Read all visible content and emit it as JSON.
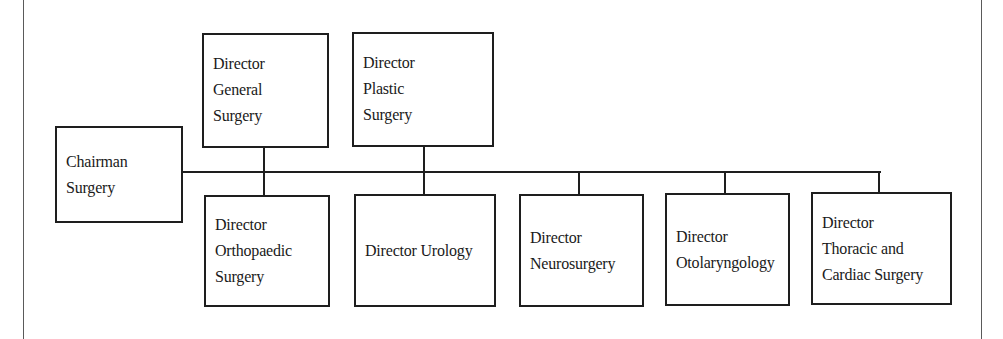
{
  "diagram": {
    "type": "org-chart",
    "root": {
      "id": "chairman",
      "lines": [
        "Chairman",
        "Surgery"
      ]
    },
    "top_row": [
      {
        "id": "general-surgery",
        "lines": [
          "Director",
          "General",
          "Surgery"
        ]
      },
      {
        "id": "plastic-surgery",
        "lines": [
          "Director",
          "Plastic",
          "Surgery"
        ]
      }
    ],
    "bottom_row": [
      {
        "id": "orthopaedic-surgery",
        "lines": [
          "Director",
          "Orthopaedic",
          "Surgery"
        ]
      },
      {
        "id": "urology",
        "lines": [
          "Director Urology"
        ]
      },
      {
        "id": "neurosurgery",
        "lines": [
          "Director",
          "Neurosurgery"
        ]
      },
      {
        "id": "otolaryngology",
        "lines": [
          "Director",
          "Otolaryngology"
        ]
      },
      {
        "id": "thoracic-cardiac-surgery",
        "lines": [
          "Director",
          "Thoracic and",
          "Cardiac Surgery"
        ]
      }
    ],
    "edges": [
      [
        "chairman",
        "general-surgery"
      ],
      [
        "chairman",
        "plastic-surgery"
      ],
      [
        "chairman",
        "orthopaedic-surgery"
      ],
      [
        "chairman",
        "urology"
      ],
      [
        "chairman",
        "neurosurgery"
      ],
      [
        "chairman",
        "otolaryngology"
      ],
      [
        "chairman",
        "thoracic-cardiac-surgery"
      ]
    ],
    "colors": {
      "line": "#1e1e1e",
      "frame": "#5a5a5a",
      "background": "#ffffff",
      "text": "#1a1a1a"
    }
  }
}
